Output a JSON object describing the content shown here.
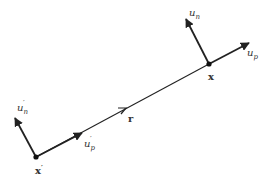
{
  "diagram": {
    "stroke_color": "#222222",
    "label_color": "#333333",
    "points": {
      "x_prime": {
        "label": "x",
        "prime": "′",
        "cx": 36,
        "cy": 157
      },
      "x": {
        "label": "x",
        "cx": 209,
        "cy": 64
      }
    },
    "vectors": {
      "u_n_prime": {
        "base": "u",
        "sub": "n",
        "prime": "′"
      },
      "u_p_prime": {
        "base": "u",
        "sub": "p",
        "prime": "′"
      },
      "u_n": {
        "base": "u",
        "sub": "n"
      },
      "u_p": {
        "base": "u",
        "sub": "p"
      },
      "r": {
        "label": "r"
      }
    }
  }
}
